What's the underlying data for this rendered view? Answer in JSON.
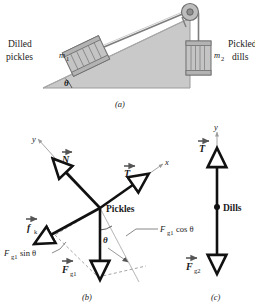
{
  "figure": {
    "title_panels": [
      "(a)",
      "(b)",
      "(c)"
    ],
    "panel_a": {
      "caption": "(a)",
      "left_label_line1": "Dilled",
      "left_label_line2": "pickles",
      "mass1_symbol": "m",
      "mass1_sub": "1",
      "mass2_symbol": "m",
      "mass2_sub": "2",
      "right_label_line1": "Pickled",
      "right_label_line2": "dills",
      "angle_label": "θ",
      "parts": [
        "incline-ramp",
        "crate-on-incline",
        "pulley",
        "cord",
        "hanging-crate"
      ]
    },
    "panel_b": {
      "caption": "(b)",
      "body_label": "Pickles",
      "axis_y": "y",
      "axis_x": "x",
      "angle_label": "θ",
      "vectors": [
        {
          "name": "normal-force",
          "symbol": "N"
        },
        {
          "name": "tension-force",
          "symbol": "T"
        },
        {
          "name": "kinetic-friction-force",
          "symbol": "f",
          "sub": "k"
        },
        {
          "name": "gravitational-force-1",
          "symbol": "F",
          "sub": "g1"
        }
      ],
      "component_sin": {
        "symbol": "F",
        "sub": "g1",
        "rest": "sin θ"
      },
      "component_cos": {
        "symbol": "F",
        "sub": "g1",
        "rest": "cos θ"
      }
    },
    "panel_c": {
      "caption": "(c)",
      "body_label": "Dills",
      "axis_y": "y",
      "vectors": [
        {
          "name": "tension-force",
          "symbol": "T"
        },
        {
          "name": "gravitational-force-2",
          "symbol": "F",
          "sub": "g2"
        }
      ]
    }
  },
  "colors": {
    "background": "#ffffff",
    "ink": "#1a1a1a",
    "ramp_fill": "#c9c9c9",
    "ramp_stroke": "#9a9a9a",
    "crate_fill": "#c4c4c4",
    "crate_stroke": "#777777",
    "guide_gray": "#9b9b9b"
  }
}
